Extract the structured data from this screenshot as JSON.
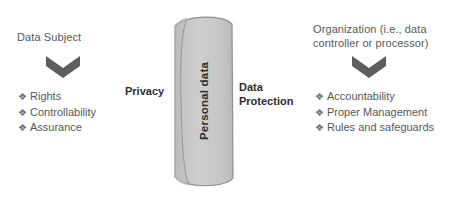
{
  "diagram": {
    "title_text_color": "#58585a",
    "accent_color": "#c4c4c4",
    "chevron_color": "#5e5e5e",
    "left": {
      "heading": "Data Subject",
      "arrow_icon": "chevron-down-icon",
      "items": [
        {
          "bullet": "❖",
          "label": "Rights"
        },
        {
          "bullet": "❖",
          "label": "Controllability"
        },
        {
          "bullet": "❖",
          "label": "Assurance"
        }
      ],
      "side_label": "Privacy"
    },
    "center": {
      "shape_icon": "cylinder-icon",
      "label": "Personal data",
      "fill_color": "#c9c9c9",
      "stroke_color": "#8c8c8c"
    },
    "right": {
      "heading_line1": "Organization (i.e., data",
      "heading_line2": "controller or processor)",
      "arrow_icon": "chevron-down-icon",
      "items": [
        {
          "bullet": "❖",
          "label": "Accountability"
        },
        {
          "bullet": "❖",
          "label": "Proper Management"
        },
        {
          "bullet": "❖",
          "label": "Rules and safeguards"
        }
      ],
      "side_label_line1": "Data",
      "side_label_line2": "Protection"
    }
  }
}
